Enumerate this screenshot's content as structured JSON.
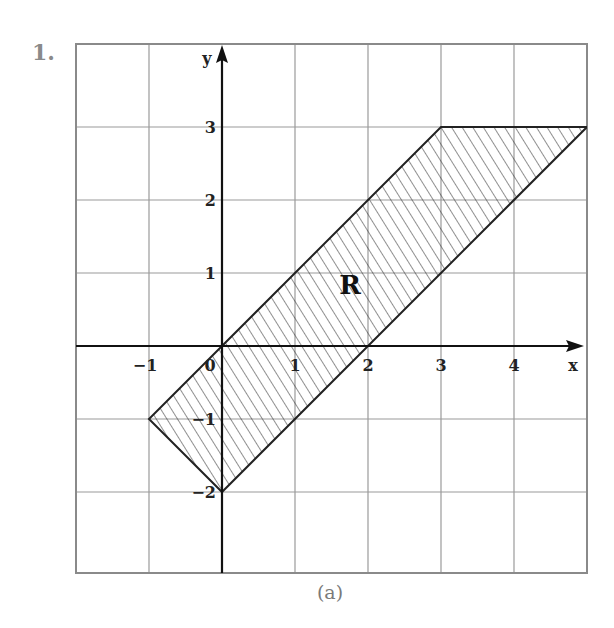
{
  "problem": {
    "number": "1."
  },
  "figure": {
    "caption": "(a)",
    "region_label": "R",
    "axes": {
      "x_label": "x",
      "y_label": "y",
      "x_range": [
        -2,
        5
      ],
      "y_range": [
        -3,
        4
      ],
      "x_ticks": [
        {
          "value": -1,
          "label": "−1"
        },
        {
          "value": 0,
          "label": "0"
        },
        {
          "value": 1,
          "label": "1"
        },
        {
          "value": 2,
          "label": "2"
        },
        {
          "value": 3,
          "label": "3"
        },
        {
          "value": 4,
          "label": "4"
        }
      ],
      "y_ticks": [
        {
          "value": 3,
          "label": "3"
        },
        {
          "value": 2,
          "label": "2"
        },
        {
          "value": 1,
          "label": "1"
        },
        {
          "value": -1,
          "label": "−1"
        },
        {
          "value": -2,
          "label": "−2"
        }
      ]
    },
    "region_vertices": [
      [
        0,
        0
      ],
      [
        3,
        3
      ],
      [
        5,
        3
      ],
      [
        2,
        0
      ],
      [
        0,
        -2
      ],
      [
        -1,
        -1
      ]
    ],
    "colors": {
      "grid": "#9a9a9a",
      "axis": "#111111",
      "outline": "#222222",
      "hatch": "#333333",
      "muted_text": "#7a7a7a"
    }
  },
  "footer": {
    "cutoff_text": ""
  }
}
